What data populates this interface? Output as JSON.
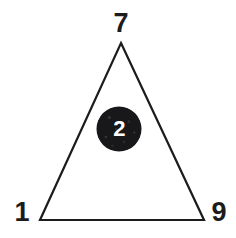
{
  "figure": {
    "background_color": "#ffffff",
    "shape": {
      "name": "triangle",
      "stroke_color": "#1c1c1c",
      "stroke_width": 2.2,
      "fill": "none",
      "points": "121,43 204,220 40,220"
    },
    "vertex_labels": [
      {
        "id": "top",
        "value": "7",
        "x": 121,
        "y": 23
      },
      {
        "id": "left",
        "value": "1",
        "x": 22,
        "y": 212
      },
      {
        "id": "right",
        "value": "9",
        "x": 219,
        "y": 212
      }
    ],
    "center_node": {
      "value": "2",
      "fill_color": "#18181a",
      "text_color": "#ffffff",
      "diameter": 44,
      "x": 119,
      "y": 129
    }
  }
}
